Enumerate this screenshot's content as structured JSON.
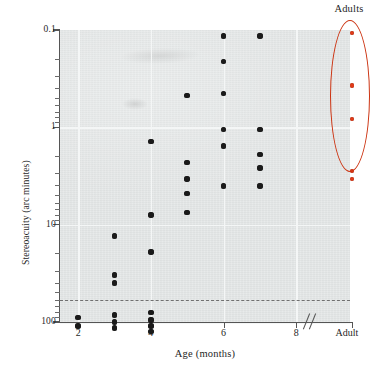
{
  "chart_data": {
    "type": "scatter",
    "title": "",
    "xlabel": "Age (months)",
    "ylabel": "Stereoacuity (arc minutes)",
    "yscale": "log",
    "y_inverted": true,
    "ylim": [
      0.1,
      100
    ],
    "y_ticklabels": [
      "0.1",
      "1",
      "10",
      "100"
    ],
    "y_tickvalues": [
      0.1,
      1,
      10,
      100
    ],
    "xlim": [
      1.5,
      8.6
    ],
    "x_ticklabels": [
      "2",
      "4",
      "6",
      "8",
      "Adult"
    ],
    "x_tickvalues": [
      2,
      4,
      6,
      8,
      10.4
    ],
    "axis_break": true,
    "axis_break_symbol": "//",
    "grid": true,
    "legend": "none",
    "annotations": [
      {
        "text": "Adults",
        "type": "ellipse-callout",
        "color": "#cc3311"
      }
    ],
    "reference_line": {
      "type": "horizontal-dashed",
      "value": 60,
      "label": ""
    },
    "series": [
      {
        "name": "Infants",
        "color": "#1a1a1a",
        "points": [
          {
            "x": 2,
            "y": 90
          },
          {
            "x": 2,
            "y": 110
          },
          {
            "x": 3,
            "y": 13
          },
          {
            "x": 3,
            "y": 33
          },
          {
            "x": 3,
            "y": 40
          },
          {
            "x": 3,
            "y": 85
          },
          {
            "x": 3,
            "y": 100
          },
          {
            "x": 3,
            "y": 115
          },
          {
            "x": 4,
            "y": 1.4
          },
          {
            "x": 4,
            "y": 8.0
          },
          {
            "x": 4,
            "y": 19
          },
          {
            "x": 4,
            "y": 80
          },
          {
            "x": 4,
            "y": 95
          },
          {
            "x": 4,
            "y": 110
          },
          {
            "x": 4,
            "y": 125
          },
          {
            "x": 5,
            "y": 0.47
          },
          {
            "x": 5,
            "y": 2.3
          },
          {
            "x": 5,
            "y": 3.4
          },
          {
            "x": 5,
            "y": 4.8
          },
          {
            "x": 5,
            "y": 7.5
          },
          {
            "x": 6,
            "y": 0.115
          },
          {
            "x": 6,
            "y": 0.21
          },
          {
            "x": 6,
            "y": 0.45
          },
          {
            "x": 6,
            "y": 1.05
          },
          {
            "x": 6,
            "y": 1.55
          },
          {
            "x": 6,
            "y": 4.0
          },
          {
            "x": 7,
            "y": 0.115
          },
          {
            "x": 7,
            "y": 1.05
          },
          {
            "x": 7,
            "y": 1.9
          },
          {
            "x": 7,
            "y": 2.6
          },
          {
            "x": 7,
            "y": 4.0
          }
        ]
      },
      {
        "name": "Adults",
        "color": "#e03a18",
        "points": [
          {
            "x": 10.4,
            "y": 0.107
          },
          {
            "x": 10.4,
            "y": 0.37
          },
          {
            "x": 10.4,
            "y": 0.82
          },
          {
            "x": 10.4,
            "y": 2.8
          },
          {
            "x": 10.4,
            "y": 3.4
          }
        ]
      }
    ]
  },
  "axes": {
    "y_title": "Stereoacuity (arc minutes)",
    "x_title": "Age (months)",
    "y_ticks": [
      {
        "label": "0.1",
        "value": 0.1
      },
      {
        "label": "1",
        "value": 1
      },
      {
        "label": "10",
        "value": 10
      },
      {
        "label": "100",
        "value": 100
      }
    ],
    "x_ticks": [
      {
        "label": "2",
        "value": 2
      },
      {
        "label": "4",
        "value": 4
      },
      {
        "label": "6",
        "value": 6
      },
      {
        "label": "8",
        "value": 8
      },
      {
        "label": "Adult",
        "value": 10.4
      }
    ]
  },
  "callout": {
    "label": "Adults",
    "color": "#cc3311"
  },
  "colors": {
    "panel": "#e3e6e6",
    "grid": "#f4f6f6",
    "axis": "#555555",
    "point": "#1a1a1a",
    "adult_point": "#e03a18",
    "ellipse": "#cc3311",
    "dashed_line": "#707070"
  }
}
